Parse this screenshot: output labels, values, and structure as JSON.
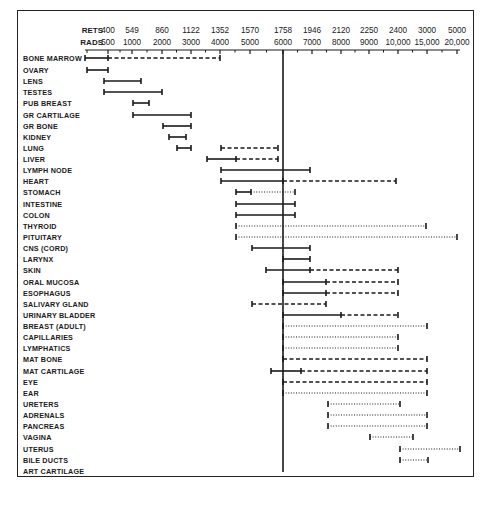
{
  "chart_data": {
    "type": "range-bar",
    "title": "",
    "xlabel": "RADS (with RETS equivalents)",
    "ylabel": "Organ / Tissue",
    "axis_rows": [
      {
        "name": "RETS",
        "ticks": [
          "400",
          "549",
          "860",
          "1122",
          "1352",
          "1570",
          "1758",
          "1946",
          "2120",
          "2250",
          "2400",
          "3000",
          "5000"
        ]
      },
      {
        "name": "RADS",
        "ticks": [
          "500",
          "1000",
          "2000",
          "3000",
          "4000",
          "5000",
          "6000",
          "7000",
          "8000",
          "9000",
          "10,000",
          "15,000",
          "20,000"
        ]
      }
    ],
    "tick_rads": [
      500,
      1000,
      2000,
      3000,
      4000,
      5000,
      6000,
      7000,
      8000,
      9000,
      10000,
      15000,
      20000
    ],
    "tick_px": [
      108,
      132,
      162,
      191,
      220,
      250,
      283,
      312,
      341,
      369,
      398,
      427,
      457
    ],
    "reference_line": {
      "rads": 6000,
      "rets": 1758
    },
    "legend_note": "solid = line segment; dashed = dashed segment; dotted = dotted segment",
    "categories": [
      "BONE MARROW",
      "OVARY",
      "LENS",
      "TESTES",
      "PUB BREAST",
      "GR CARTILAGE",
      "GR BONE",
      "KIDNEY",
      "LUNG",
      "LIVER",
      "LYMPH NODE",
      "HEART",
      "STOMACH",
      "INTESTINE",
      "COLON",
      "THYROID",
      "PITUITARY",
      "CNS (CORD)",
      "LARYNX",
      "SKIN",
      "ORAL MUCOSA",
      "ESOPHAGUS",
      "SALIVARY GLAND",
      "URINARY BLADDER",
      "BREAST (ADULT)",
      "CAPILLARIES",
      "LYMPHATICS",
      "MAT BONE",
      "MAT CARTILAGE",
      "EYE",
      "EAR",
      "URETERS",
      "ADRENALS",
      "PANCREAS",
      "VAGINA",
      "UTERUS",
      "BILE DUCTS",
      "ART CARTILAGE"
    ],
    "rows": [
      {
        "label": "BONE MARROW",
        "segments": [
          {
            "style": "solid",
            "from_px": 85,
            "to_px": 108,
            "from_rads": 250,
            "to_rads": 500
          },
          {
            "style": "dashed",
            "from_px": 108,
            "to_px": 220,
            "from_rads": 500,
            "to_rads": 4000
          }
        ]
      },
      {
        "label": "OVARY",
        "segments": [
          {
            "style": "solid",
            "from_px": 87,
            "to_px": 108,
            "from_rads": 300,
            "to_rads": 500
          }
        ]
      },
      {
        "label": "LENS",
        "segments": [
          {
            "style": "solid",
            "from_px": 104,
            "to_px": 141,
            "from_rads": 500,
            "to_rads": 1250
          }
        ]
      },
      {
        "label": "TESTES",
        "segments": [
          {
            "style": "solid",
            "from_px": 104,
            "to_px": 162,
            "from_rads": 500,
            "to_rads": 2000
          }
        ]
      },
      {
        "label": "PUB BREAST",
        "segments": [
          {
            "style": "solid",
            "from_px": 133,
            "to_px": 149,
            "from_rads": 1000,
            "to_rads": 1500
          }
        ]
      },
      {
        "label": "GR CARTILAGE",
        "segments": [
          {
            "style": "solid",
            "from_px": 133,
            "to_px": 191,
            "from_rads": 1000,
            "to_rads": 3000
          }
        ]
      },
      {
        "label": "GR BONE",
        "segments": [
          {
            "style": "solid",
            "from_px": 163,
            "to_px": 191,
            "from_rads": 2000,
            "to_rads": 3000
          }
        ]
      },
      {
        "label": "KIDNEY",
        "segments": [
          {
            "style": "solid",
            "from_px": 169,
            "to_px": 186,
            "from_rads": 2200,
            "to_rads": 2800
          }
        ]
      },
      {
        "label": "LUNG",
        "segments": [
          {
            "style": "solid",
            "from_px": 177,
            "to_px": 191,
            "from_rads": 2500,
            "to_rads": 3000
          },
          {
            "style": "dashed",
            "from_px": 221,
            "to_px": 278,
            "from_rads": 4000,
            "to_rads": 5800
          }
        ]
      },
      {
        "label": "LIVER",
        "segments": [
          {
            "style": "solid",
            "from_px": 207,
            "to_px": 236,
            "from_rads": 3500,
            "to_rads": 4500
          },
          {
            "style": "dashed",
            "from_px": 236,
            "to_px": 278,
            "from_rads": 4500,
            "to_rads": 5800
          }
        ]
      },
      {
        "label": "LYMPH NODE",
        "segments": [
          {
            "style": "solid",
            "from_px": 221,
            "to_px": 310,
            "from_rads": 4000,
            "to_rads": 7000
          }
        ]
      },
      {
        "label": "HEART",
        "segments": [
          {
            "style": "solid",
            "from_px": 221,
            "to_px": 283,
            "from_rads": 4000,
            "to_rads": 6000
          },
          {
            "style": "dashed",
            "from_px": 283,
            "to_px": 396,
            "from_rads": 6000,
            "to_rads": 10000
          }
        ]
      },
      {
        "label": "STOMACH",
        "segments": [
          {
            "style": "solid",
            "from_px": 236,
            "to_px": 251,
            "from_rads": 4500,
            "to_rads": 5000
          },
          {
            "style": "dotted",
            "from_px": 251,
            "to_px": 295,
            "from_rads": 5000,
            "to_rads": 6500
          }
        ]
      },
      {
        "label": "INTESTINE",
        "segments": [
          {
            "style": "solid",
            "from_px": 236,
            "to_px": 295,
            "from_rads": 4500,
            "to_rads": 6500
          }
        ]
      },
      {
        "label": "COLON",
        "segments": [
          {
            "style": "solid",
            "from_px": 236,
            "to_px": 295,
            "from_rads": 4500,
            "to_rads": 6500
          }
        ]
      },
      {
        "label": "THYROID",
        "segments": [
          {
            "style": "dotted",
            "from_px": 236,
            "to_px": 426,
            "from_rads": 4500,
            "to_rads": 15000
          }
        ]
      },
      {
        "label": "PITUITARY",
        "segments": [
          {
            "style": "dotted",
            "from_px": 236,
            "to_px": 457,
            "from_rads": 4500,
            "to_rads": 20000
          }
        ]
      },
      {
        "label": "CNS (CORD)",
        "segments": [
          {
            "style": "solid",
            "from_px": 252,
            "to_px": 310,
            "from_rads": 5000,
            "to_rads": 7000
          }
        ]
      },
      {
        "label": "LARYNX",
        "segments": [
          {
            "style": "solid",
            "from_px": 283,
            "to_px": 310,
            "from_rads": 6000,
            "to_rads": 7000
          }
        ]
      },
      {
        "label": "SKIN",
        "segments": [
          {
            "style": "solid",
            "from_px": 266,
            "to_px": 310,
            "from_rads": 5500,
            "to_rads": 7000
          },
          {
            "style": "dashed",
            "from_px": 310,
            "to_px": 398,
            "from_rads": 7000,
            "to_rads": 10000
          }
        ]
      },
      {
        "label": "ORAL MUCOSA",
        "segments": [
          {
            "style": "solid",
            "from_px": 283,
            "to_px": 326,
            "from_rads": 6000,
            "to_rads": 7500
          },
          {
            "style": "dashed",
            "from_px": 326,
            "to_px": 398,
            "from_rads": 7500,
            "to_rads": 10000
          }
        ]
      },
      {
        "label": "ESOPHAGUS",
        "segments": [
          {
            "style": "solid",
            "from_px": 283,
            "to_px": 326,
            "from_rads": 6000,
            "to_rads": 7500
          },
          {
            "style": "dashed",
            "from_px": 326,
            "to_px": 398,
            "from_rads": 7500,
            "to_rads": 10000
          }
        ]
      },
      {
        "label": "SALIVARY GLAND",
        "segments": [
          {
            "style": "dashed",
            "from_px": 252,
            "to_px": 326,
            "from_rads": 5000,
            "to_rads": 7500
          }
        ]
      },
      {
        "label": "URINARY BLADDER",
        "segments": [
          {
            "style": "solid",
            "from_px": 283,
            "to_px": 341,
            "from_rads": 6000,
            "to_rads": 8000
          },
          {
            "style": "dashed",
            "from_px": 341,
            "to_px": 398,
            "from_rads": 8000,
            "to_rads": 10000
          }
        ]
      },
      {
        "label": "BREAST (ADULT)",
        "segments": [
          {
            "style": "dotted",
            "from_px": 283,
            "to_px": 427,
            "from_rads": 6000,
            "to_rads": 15000
          }
        ]
      },
      {
        "label": "CAPILLARIES",
        "segments": [
          {
            "style": "dotted",
            "from_px": 283,
            "to_px": 398,
            "from_rads": 6000,
            "to_rads": 10000
          }
        ]
      },
      {
        "label": "LYMPHATICS",
        "segments": [
          {
            "style": "dotted",
            "from_px": 283,
            "to_px": 398,
            "from_rads": 6000,
            "to_rads": 10000
          }
        ]
      },
      {
        "label": "MAT BONE",
        "segments": [
          {
            "style": "dashed",
            "from_px": 283,
            "to_px": 427,
            "from_rads": 6000,
            "to_rads": 15000
          }
        ]
      },
      {
        "label": "MAT CARTILAGE",
        "segments": [
          {
            "style": "solid",
            "from_px": 271,
            "to_px": 301,
            "from_rads": 5600,
            "to_rads": 6600
          },
          {
            "style": "dashed",
            "from_px": 301,
            "to_px": 427,
            "from_rads": 6600,
            "to_rads": 15000
          }
        ]
      },
      {
        "label": "EYE",
        "segments": [
          {
            "style": "dashed",
            "from_px": 283,
            "to_px": 427,
            "from_rads": 6000,
            "to_rads": 15000
          }
        ]
      },
      {
        "label": "EAR",
        "segments": [
          {
            "style": "dotted",
            "from_px": 283,
            "to_px": 427,
            "from_rads": 6000,
            "to_rads": 15000
          }
        ]
      },
      {
        "label": "URETERS",
        "segments": [
          {
            "style": "dotted",
            "from_px": 328,
            "to_px": 400,
            "from_rads": 7500,
            "to_rads": 10000
          }
        ]
      },
      {
        "label": "ADRENALS",
        "segments": [
          {
            "style": "dotted",
            "from_px": 328,
            "to_px": 427,
            "from_rads": 7500,
            "to_rads": 15000
          }
        ]
      },
      {
        "label": "PANCREAS",
        "segments": [
          {
            "style": "dotted",
            "from_px": 328,
            "to_px": 427,
            "from_rads": 7500,
            "to_rads": 15000
          }
        ]
      },
      {
        "label": "VAGINA",
        "segments": [
          {
            "style": "dotted",
            "from_px": 370,
            "to_px": 413,
            "from_rads": 9000,
            "to_rads": 12500
          }
        ]
      },
      {
        "label": "UTERUS",
        "segments": [
          {
            "style": "dotted",
            "from_px": 400,
            "to_px": 460,
            "from_rads": 10000,
            "to_rads": 20000
          }
        ]
      },
      {
        "label": "BILE DUCTS",
        "segments": [
          {
            "style": "dotted",
            "from_px": 400,
            "to_px": 428,
            "from_rads": 10000,
            "to_rads": 15000
          }
        ]
      },
      {
        "label": "ART CARTILAGE",
        "segments": []
      }
    ],
    "row_y_px": [
      58,
      70,
      81,
      92,
      103,
      115,
      126,
      137,
      148,
      159,
      170,
      181,
      192,
      204,
      215,
      226,
      237,
      248,
      259,
      270,
      282,
      293,
      304,
      315,
      326,
      337,
      348,
      359,
      371,
      382,
      393,
      404,
      415,
      426,
      437,
      449,
      460,
      471
    ],
    "colors": {
      "ink": "#1a1a1a",
      "background": "#ffffff"
    }
  }
}
